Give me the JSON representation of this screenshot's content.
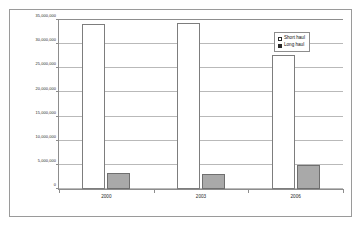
{
  "chart_data": {
    "type": "bar",
    "title": "",
    "subtitle": "",
    "xlabel": "",
    "ylabel": "",
    "categories": [
      "2000",
      "2003",
      "2006"
    ],
    "series": [
      {
        "name": "Short haul",
        "values": [
          34200000,
          34400000,
          27700000
        ],
        "color": "#ffffff"
      },
      {
        "name": "Long haul",
        "values": [
          3300000,
          3200000,
          4900000
        ],
        "color": "#a9a9a9"
      }
    ],
    "ylim": [
      0,
      35000000
    ],
    "ytick_values": [
      0,
      5000000,
      10000000,
      15000000,
      20000000,
      25000000,
      30000000,
      35000000
    ],
    "ytick_labels": [
      "0",
      "5,000,000",
      "10,000,000",
      "15,000,000",
      "20,000,000",
      "25,000,000",
      "30,000,000",
      "35,000,000"
    ],
    "grid": true,
    "legend_position": "top-right"
  },
  "legend": {
    "entries": [
      {
        "label": "Short haul"
      },
      {
        "label": "Long haul"
      }
    ]
  }
}
